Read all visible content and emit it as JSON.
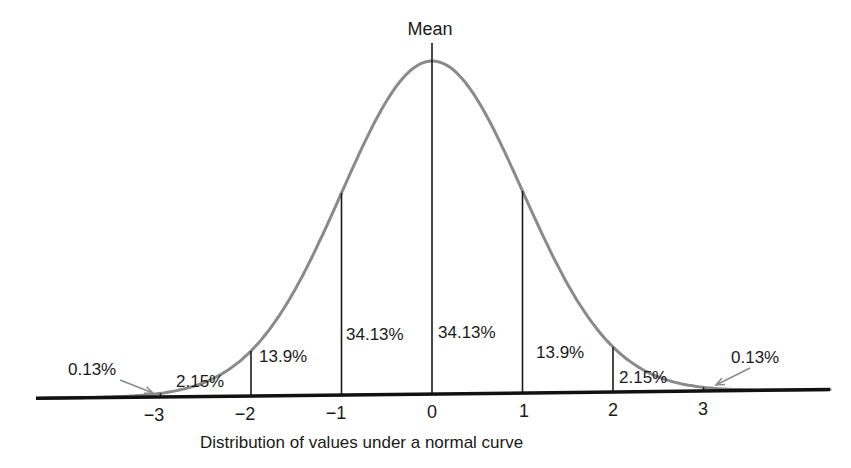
{
  "chart_data": {
    "type": "area",
    "title": "Distribution of values under a normal curve",
    "xlabel": "Distribution of values under a normal curve",
    "ylabel": "",
    "annotation_top": "Mean",
    "x_ticks": [
      {
        "value": -3,
        "label": "−3"
      },
      {
        "value": -2,
        "label": "−2"
      },
      {
        "value": -1,
        "label": "−1"
      },
      {
        "value": 0,
        "label": "0"
      },
      {
        "value": 1,
        "label": "1"
      },
      {
        "value": 2,
        "label": "2"
      },
      {
        "value": 3,
        "label": "3"
      }
    ],
    "segments": [
      {
        "range": [
          "-inf",
          -3
        ],
        "percent": 0.13,
        "label": "0.13%"
      },
      {
        "range": [
          -3,
          -2
        ],
        "percent": 2.15,
        "label": "2.15%"
      },
      {
        "range": [
          -2,
          -1
        ],
        "percent": 13.9,
        "label": "13.9%"
      },
      {
        "range": [
          -1,
          0
        ],
        "percent": 34.13,
        "label": "34.13%"
      },
      {
        "range": [
          0,
          1
        ],
        "percent": 34.13,
        "label": "34.13%"
      },
      {
        "range": [
          1,
          2
        ],
        "percent": 13.9,
        "label": "13.9%"
      },
      {
        "range": [
          2,
          3
        ],
        "percent": 2.15,
        "label": "2.15%"
      },
      {
        "range": [
          3,
          "inf"
        ],
        "percent": 0.13,
        "label": "0.13%"
      }
    ],
    "xlim": [
      -4.3,
      4.4
    ],
    "grid": false,
    "legend": "none",
    "colors": {
      "curve": "#8a8a8a",
      "lines": "#1a1a1a",
      "axis": "#111111"
    }
  }
}
